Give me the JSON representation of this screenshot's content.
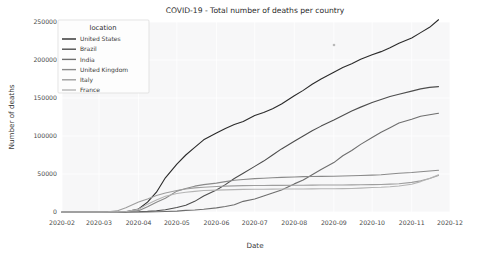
{
  "chart_data": {
    "type": "line",
    "title": "COVID-19 - Total number of deaths per country",
    "xlabel": "Date",
    "ylabel": "Number of deaths",
    "legend_title": "location",
    "legend_position": "upper left",
    "grid": true,
    "xlim": [
      "2020-02-01",
      "2020-12-01"
    ],
    "ylim": [
      0,
      250000
    ],
    "xticks": [
      "2020-02",
      "2020-03",
      "2020-04",
      "2020-05",
      "2020-06",
      "2020-07",
      "2020-08",
      "2020-09",
      "2020-10",
      "2020-11",
      "2020-12"
    ],
    "yticks": [
      0,
      50000,
      100000,
      150000,
      200000,
      250000
    ],
    "ytick_labels": [
      "0",
      "50000",
      "100000",
      "150000",
      "200000",
      "250000"
    ],
    "x": [
      "2020-02-01",
      "2020-02-15",
      "2020-03-01",
      "2020-03-08",
      "2020-03-15",
      "2020-03-22",
      "2020-04-01",
      "2020-04-08",
      "2020-04-15",
      "2020-04-22",
      "2020-05-01",
      "2020-05-08",
      "2020-05-15",
      "2020-05-22",
      "2020-06-01",
      "2020-06-08",
      "2020-06-15",
      "2020-06-22",
      "2020-07-01",
      "2020-07-08",
      "2020-07-15",
      "2020-07-22",
      "2020-08-01",
      "2020-08-08",
      "2020-08-15",
      "2020-08-22",
      "2020-09-01",
      "2020-09-08",
      "2020-09-15",
      "2020-09-22",
      "2020-10-01",
      "2020-10-08",
      "2020-10-15",
      "2020-10-22",
      "2020-11-01",
      "2020-11-08",
      "2020-11-15",
      "2020-11-22"
    ],
    "series": [
      {
        "name": "United States",
        "color": "#2a2a2a",
        "values": [
          0,
          0,
          1,
          20,
          60,
          400,
          4000,
          13000,
          26000,
          45000,
          63000,
          75000,
          85000,
          95000,
          104000,
          110000,
          115000,
          119000,
          127000,
          131000,
          136000,
          142000,
          153000,
          160000,
          168000,
          175000,
          184000,
          190000,
          195000,
          201000,
          207000,
          211000,
          216000,
          222000,
          229000,
          236000,
          243000,
          253000
        ]
      },
      {
        "name": "Brazil",
        "color": "#4d4d4d",
        "values": [
          0,
          0,
          0,
          0,
          1,
          25,
          240,
          800,
          1700,
          3000,
          6000,
          9000,
          14000,
          21000,
          29000,
          36000,
          44000,
          51000,
          60000,
          67000,
          75000,
          83000,
          93000,
          100000,
          107000,
          113000,
          121000,
          127000,
          133000,
          138000,
          144000,
          148000,
          152000,
          155000,
          159000,
          162000,
          164000,
          165000
        ]
      },
      {
        "name": "India",
        "color": "#6e6e6e",
        "values": [
          0,
          0,
          0,
          0,
          0,
          4,
          35,
          150,
          400,
          700,
          1200,
          2100,
          2700,
          3600,
          5400,
          7200,
          9500,
          14000,
          17000,
          21000,
          25000,
          29000,
          37000,
          42000,
          49000,
          56000,
          65000,
          74000,
          81000,
          89000,
          98000,
          105000,
          111000,
          117000,
          122000,
          126000,
          128000,
          130000
        ]
      },
      {
        "name": "United Kingdom",
        "color": "#8a8a8a",
        "values": [
          0,
          0,
          0,
          3,
          21,
          281,
          1800,
          7000,
          12900,
          18000,
          27500,
          31000,
          34000,
          36000,
          38000,
          40000,
          41700,
          42700,
          43900,
          44500,
          45000,
          45500,
          46000,
          46500,
          46700,
          46900,
          47100,
          47400,
          47700,
          48000,
          48500,
          49000,
          50000,
          51000,
          52000,
          53000,
          54000,
          55000
        ]
      },
      {
        "name": "Italy",
        "color": "#9e9e9e",
        "values": [
          0,
          0,
          29,
          366,
          1441,
          5476,
          13155,
          17127,
          21645,
          25085,
          28236,
          30201,
          31763,
          32616,
          33475,
          34043,
          34405,
          34657,
          34818,
          34914,
          35017,
          35097,
          35181,
          35231,
          35400,
          35458,
          35541,
          35624,
          35707,
          35851,
          36000,
          36200,
          36700,
          37200,
          39000,
          41000,
          44000,
          48000
        ]
      },
      {
        "name": "France",
        "color": "#b4b4b4",
        "values": [
          0,
          0,
          2,
          30,
          120,
          674,
          3523,
          10343,
          15748,
          20796,
          24376,
          25990,
          27074,
          28218,
          28833,
          29142,
          29407,
          29731,
          29875,
          30004,
          30120,
          30192,
          30265,
          30340,
          30451,
          30544,
          30686,
          30820,
          31000,
          31400,
          32200,
          32500,
          33200,
          34200,
          36500,
          40000,
          44000,
          49000
        ]
      }
    ]
  },
  "artifacts": {
    "speck_label": "scan-speck"
  }
}
